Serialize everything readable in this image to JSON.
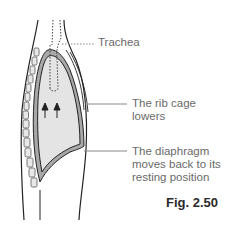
{
  "labels": {
    "trachea": "Trachea",
    "rib_cage_line1": "The rib cage",
    "rib_cage_line2": "lowers",
    "diaphragm_line1": "The diaphragm",
    "diaphragm_line2": "moves back to its",
    "diaphragm_line3": "resting position"
  },
  "figure": {
    "caption": "Fig. 2.50"
  },
  "colors": {
    "outline": "#222222",
    "lung_fill": "#e4e4e4",
    "pleura_fill": "#a8a8a8",
    "leader_line": "#888888",
    "text": "#6a6a6a"
  },
  "icons": {
    "arrows": "up-arrows-icon"
  }
}
